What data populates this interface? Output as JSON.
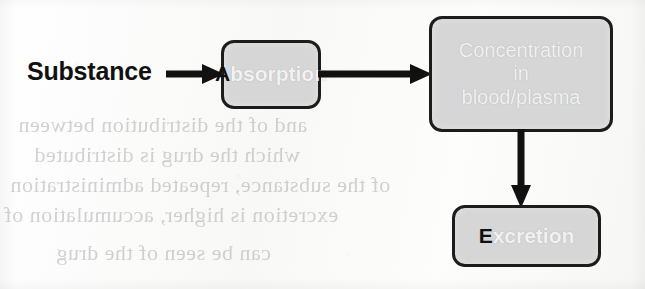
{
  "diagram": {
    "type": "flowchart",
    "source_label": "Substance",
    "nodes": [
      {
        "id": "absorption",
        "cap": "A",
        "rest": "bsorption",
        "full_text": "Absorption",
        "shape": "rounded-rectangle",
        "fill": "#d6d6d6",
        "border": "#1c1c1c"
      },
      {
        "id": "concentration",
        "line1": "Concentration",
        "line2": "in",
        "line3": "blood/plasma",
        "full_text": "Concentration in blood/plasma",
        "shape": "rounded-rectangle",
        "fill": "#d6d6d6",
        "border": "#1c1c1c"
      },
      {
        "id": "excretion",
        "cap": "E",
        "rest": "xcretion",
        "full_text": "Excretion",
        "shape": "rounded-rectangle",
        "fill": "#d6d6d6",
        "border": "#1c1c1c"
      }
    ],
    "edges": [
      {
        "id": "substance-absorption",
        "from": "Substance",
        "to": "Absorption",
        "direction": "right"
      },
      {
        "id": "absorption-concentration",
        "from": "Absorption",
        "to": "Concentration in blood/plasma",
        "direction": "right"
      },
      {
        "id": "concentration-excretion",
        "from": "Concentration in blood/plasma",
        "to": "Excretion",
        "direction": "down"
      }
    ]
  },
  "bleed_through": {
    "note": "faint mirrored text showing through from the reverse side of the scanned page",
    "lines": [
      {
        "text": "and of the distribution between"
      },
      {
        "text": "which the drug is distributed"
      },
      {
        "text": "of the substance, repeated administration"
      },
      {
        "text": "excretion is higher, accumulation of"
      },
      {
        "text": "can be seen of the drug"
      }
    ]
  }
}
